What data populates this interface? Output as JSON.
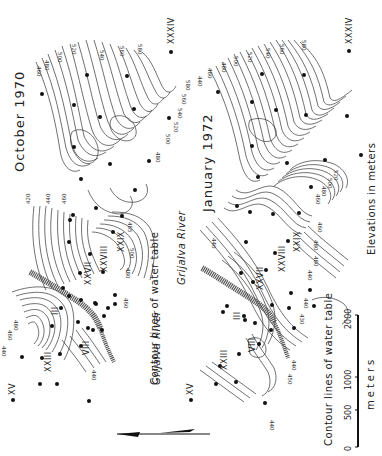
{
  "figure": {
    "orientation": "rotated 90 degrees counter-clockwise",
    "panels": [
      {
        "id": "top",
        "title": "October 1970",
        "river_label": "Grijalva River",
        "caption": "Contour lines of water table",
        "well_labels": [
          "XXXIV",
          "XV",
          "XXIII",
          "III",
          "VIII",
          "XXVII",
          "XXVIII",
          "XXIX"
        ],
        "contour_labels": [
          "420",
          "440",
          "460",
          "465",
          "480",
          "500",
          "520",
          "540",
          "560",
          "580",
          "460",
          "480",
          "500",
          "520",
          "540",
          "560",
          "580",
          "480",
          "460",
          "440",
          "480",
          "500"
        ]
      },
      {
        "id": "bottom",
        "title": "January 1972",
        "river_label": "Grijalva River",
        "caption": "Contour lines of water table",
        "well_labels": [
          "XXXIV",
          "XV",
          "XXIII",
          "III",
          "VIII",
          "XXVII",
          "XXVIII",
          "XXIX"
        ],
        "contour_labels": [
          "440",
          "460",
          "480",
          "500",
          "520",
          "540",
          "560",
          "580",
          "460",
          "480",
          "500",
          "520",
          "440",
          "460",
          "440",
          "430",
          "440",
          "460",
          "480",
          "460",
          "440"
        ]
      }
    ],
    "legend": {
      "elevation_note": "Elevations in meters",
      "scale_bar": {
        "unit": "meters",
        "ticks": [
          "0",
          "500",
          "1000",
          "2000"
        ]
      },
      "north_arrow": "north-arrow"
    },
    "colors": {
      "ink": "#222222",
      "river_fill": "#555555",
      "background": "#ffffff"
    }
  }
}
